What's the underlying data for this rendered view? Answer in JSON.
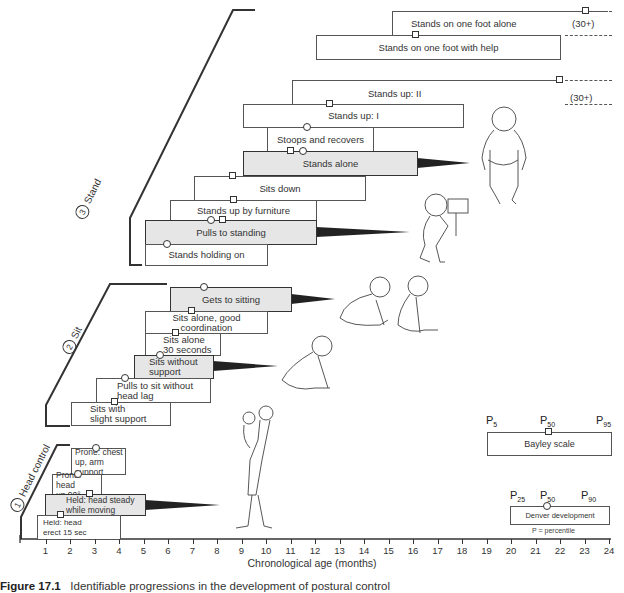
{
  "chart_data": {
    "type": "timeline",
    "title": "Identifiable progressions in the development of postural control",
    "caption_prefix": "Figure 17.1",
    "xlabel": "Chronological age (months)",
    "xlim": [
      0,
      24
    ],
    "x_ticks": [
      "1",
      "2",
      "3",
      "4",
      "5",
      "6",
      "7",
      "8",
      "9",
      "10",
      "11",
      "12",
      "13",
      "14",
      "15",
      "16",
      "17",
      "18",
      "19",
      "20",
      "21",
      "22",
      "23",
      "24"
    ],
    "legend": {
      "bayley": {
        "label": "Bayley scale",
        "marker": "square",
        "percentiles": [
          "P5",
          "P50",
          "P95"
        ]
      },
      "denver": {
        "label": "Denver development",
        "marker": "circle",
        "percentiles": [
          "P25",
          "P50",
          "P90"
        ]
      },
      "note": "P =  percentile"
    },
    "sections": [
      {
        "number": "3",
        "name": "Stand",
        "milestones": [
          {
            "label": "Stands on one foot alone",
            "start": 15.5,
            "end": 24,
            "bayley_p50": 23.0,
            "note": "(30+)",
            "open_ended": true
          },
          {
            "label": "Stands on one foot with help",
            "start": 12.0,
            "end": 22.0,
            "bayley_p50": 16.1
          },
          {
            "label": "Stands up: II",
            "start": 11.0,
            "end": 24,
            "bayley_p50": 22.0,
            "note": "(30+)",
            "open_ended": true
          },
          {
            "label": "Stands up: I",
            "start": 9.0,
            "end": 18.0,
            "bayley_p50": 12.6
          },
          {
            "label": "Stoops and recovers",
            "start": 10.0,
            "end": 14.3,
            "denver_p50": 11.6
          },
          {
            "label": "Stands alone",
            "start": 9.0,
            "end": 16.2,
            "bayley_p50": 11.0,
            "denver_p50": 11.5,
            "highlight": true
          },
          {
            "label": "Sits down",
            "start": 7.0,
            "end": 14.0,
            "bayley_p50": 8.6
          },
          {
            "label": "Stands up by furniture",
            "start": 6.0,
            "end": 12.0,
            "bayley_p50": 8.2
          },
          {
            "label": "Pulls to standing",
            "start": 6.0,
            "end": 12.0,
            "denver_p50": 7.7,
            "bayley_p50": 8.2,
            "highlight": true
          },
          {
            "label": "Stands holding on",
            "start": 5.0,
            "end": 10.0,
            "denver_p50": 6.0
          }
        ]
      },
      {
        "number": "2",
        "name": "Sit",
        "milestones": [
          {
            "label": "Gets to sitting",
            "start": 6.0,
            "end": 11.0,
            "denver_p50": 7.5,
            "highlight": true
          },
          {
            "label": "Sits alone, good coordination",
            "start": 5.0,
            "end": 10.0,
            "bayley_p50": 8.2
          },
          {
            "label": "Sits alone 30 seconds",
            "start": 5.0,
            "end": 8.1,
            "bayley_p50": 7.5
          },
          {
            "label": "Sits without support",
            "start": 4.6,
            "end": 7.8,
            "denver_p50": 7.0,
            "highlight": true
          },
          {
            "label": "Pulls to sit without head lag",
            "start": 3.1,
            "end": 7.7,
            "denver_p50": 4.2
          },
          {
            "label": "Sits with slight support",
            "start": 2.0,
            "end": 6.0,
            "bayley_p50": 3.8
          }
        ]
      },
      {
        "number": "1",
        "name": "Head control",
        "milestones": [
          {
            "label": "Prone: chest up, arm support",
            "start": 2.0,
            "end": 4.2,
            "denver_p50": 3.0
          },
          {
            "label": "Prone: head up 90°",
            "start": 1.3,
            "end": 3.3,
            "denver_p50": 2.3
          },
          {
            "label": "Held: head steady while moving",
            "start": 1.0,
            "end": 5.1,
            "bayley_p50": 2.8,
            "highlight": true
          },
          {
            "label": "Held: head erect 15 sec",
            "start": 0.7,
            "end": 4.0,
            "bayley_p50": 1.6
          }
        ]
      }
    ]
  },
  "figure": {
    "caption_bold": "Figure 17.1",
    "caption_text": "Identifiable progressions in the development of postural control",
    "xlabel": "Chronological age (months)",
    "section_labels": {
      "stand": "Stand",
      "sit": "Sit",
      "head": "Head control"
    },
    "section_numbers": {
      "stand": "3",
      "sit": "2",
      "head": "1"
    },
    "boxes": {
      "s_one_foot_alone": "Stands on one foot alone",
      "s_one_foot_help": "Stands on one foot with help",
      "s_up_2": "Stands up:  II",
      "s_up_1": "Stands up:  I",
      "s_stoops": "Stoops and recovers",
      "s_alone": "Stands alone",
      "s_sits_down": "Sits down",
      "s_by_furniture": "Stands up by furniture",
      "s_pulls": "Pulls to standing",
      "s_holding": "Stands holding on",
      "t_gets": "Gets to sitting",
      "t_good": "Sits alone, good coordination",
      "t_30a": "Sits alone",
      "t_30b": "30 seconds",
      "t_without_a": "Sits without",
      "t_without_b": "support",
      "t_pulls_a": "Pulls to sit without",
      "t_pulls_b": "head lag",
      "t_slight_a": "Sits with",
      "t_slight_b": "slight support",
      "h_chest_a": "Prone:  chest",
      "h_chest_b": "up, arm support",
      "h_head90_a": "Prone:  head",
      "h_head90_b": "up 90°",
      "h_steady_a": "Held:  head steady",
      "h_steady_b": "while moving",
      "h_erect_a": "Held:  head",
      "h_erect_b": "erect 15 sec"
    },
    "plus30": "(30+)",
    "legend": {
      "bayley": "Bayley scale",
      "denver": "Denver development",
      "p5": "P",
      "p5s": "5",
      "p50": "P",
      "p50s": "50",
      "p95": "P",
      "p95s": "95",
      "p25": "P",
      "p25s": "25",
      "p90": "P",
      "p90s": "90",
      "note": "P =  percentile"
    }
  }
}
